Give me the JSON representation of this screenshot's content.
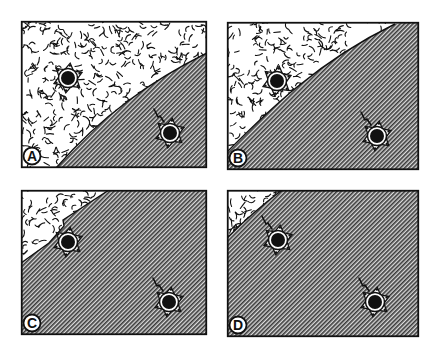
{
  "colors": {
    "ink": "#111111",
    "hatch_light": "#d9d9d9",
    "hatch_dark": "#3a3a3a",
    "background": "#ffffff"
  },
  "panels": [
    {
      "label": "A",
      "x": 21,
      "y": 21,
      "w": 186,
      "h": 147,
      "boundary": "M 35 147 C 80 95, 130 60, 186 32",
      "notch": false,
      "cells": [
        {
          "cx": 47,
          "cy": 57,
          "region": "textured",
          "tail": false
        },
        {
          "cx": 149,
          "cy": 112,
          "region": "hatched",
          "tail": true,
          "tail_dir": "up-left"
        }
      ]
    },
    {
      "label": "B",
      "x": 227,
      "y": 22,
      "w": 192,
      "h": 148,
      "boundary": "M 0 130 C 40 90, 90 40, 168 2",
      "notch": false,
      "cells": [
        {
          "cx": 50,
          "cy": 59,
          "region": "border",
          "tail": false
        },
        {
          "cx": 150,
          "cy": 114,
          "region": "hatched",
          "tail": true,
          "tail_dir": "up-left"
        }
      ]
    },
    {
      "label": "C",
      "x": 21,
      "y": 190,
      "w": 186,
      "h": 145,
      "boundary": "M 0 73 L 28 53 L 43 36 L 42 30 L 88 0",
      "notch": true,
      "cells": [
        {
          "cx": 47,
          "cy": 52,
          "region": "border",
          "tail": false
        },
        {
          "cx": 148,
          "cy": 112,
          "region": "hatched",
          "tail": true,
          "tail_dir": "up-left"
        }
      ]
    },
    {
      "label": "D",
      "x": 227,
      "y": 190,
      "w": 192,
      "h": 147,
      "boundary": "M 0 48 C 18 30, 34 16, 55 0",
      "notch": false,
      "cells": [
        {
          "cx": 51,
          "cy": 50,
          "region": "hatched",
          "tail": true,
          "tail_dir": "up-left"
        },
        {
          "cx": 148,
          "cy": 112,
          "region": "hatched",
          "tail": true,
          "tail_dir": "up-left"
        }
      ]
    }
  ]
}
